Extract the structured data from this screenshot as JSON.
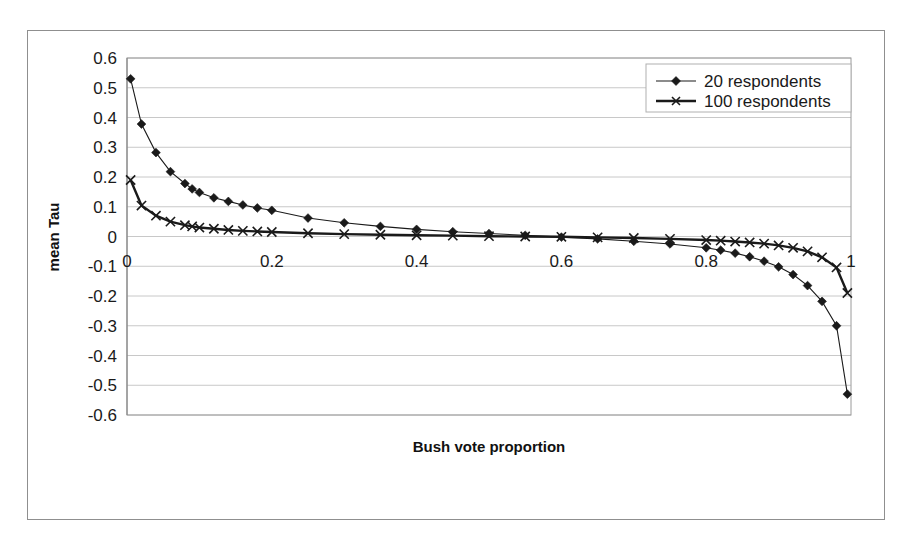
{
  "chart_data": {
    "type": "line",
    "title": "",
    "xlabel": "Bush vote proportion",
    "ylabel": "mean Tau",
    "xlim": [
      0,
      1
    ],
    "ylim": [
      -0.6,
      0.6
    ],
    "grid": true,
    "legend_position": "top-right",
    "xticks": [
      "0",
      "0.2",
      "0.4",
      "0.6",
      "0.8",
      "1"
    ],
    "xtick_values": [
      0,
      0.2,
      0.4,
      0.6,
      0.8,
      1
    ],
    "yticks": [
      "0.6",
      "0.5",
      "0.4",
      "0.3",
      "0.2",
      "0.1",
      "0",
      "-0.1",
      "-0.2",
      "-0.3",
      "-0.4",
      "-0.5",
      "-0.6"
    ],
    "ytick_values": [
      0.6,
      0.5,
      0.4,
      0.3,
      0.2,
      0.1,
      0,
      -0.1,
      -0.2,
      -0.3,
      -0.4,
      -0.5,
      -0.6
    ],
    "series": [
      {
        "name": "20 respondents",
        "marker": "diamond",
        "x": [
          0.005,
          0.02,
          0.04,
          0.06,
          0.08,
          0.09,
          0.1,
          0.12,
          0.14,
          0.16,
          0.18,
          0.2,
          0.25,
          0.3,
          0.35,
          0.4,
          0.45,
          0.5,
          0.55,
          0.6,
          0.65,
          0.7,
          0.75,
          0.8,
          0.82,
          0.84,
          0.86,
          0.88,
          0.9,
          0.92,
          0.94,
          0.96,
          0.98,
          0.995
        ],
        "values": [
          0.53,
          0.378,
          0.282,
          0.218,
          0.178,
          0.16,
          0.148,
          0.13,
          0.118,
          0.106,
          0.096,
          0.088,
          0.062,
          0.046,
          0.034,
          0.024,
          0.016,
          0.01,
          0.004,
          -0.002,
          -0.008,
          -0.016,
          -0.025,
          -0.038,
          -0.046,
          -0.056,
          -0.068,
          -0.083,
          -0.102,
          -0.128,
          -0.165,
          -0.218,
          -0.3,
          -0.53
        ]
      },
      {
        "name": "100 respondents",
        "marker": "x",
        "x": [
          0.005,
          0.02,
          0.04,
          0.06,
          0.08,
          0.09,
          0.1,
          0.12,
          0.14,
          0.16,
          0.18,
          0.2,
          0.25,
          0.3,
          0.35,
          0.4,
          0.45,
          0.5,
          0.55,
          0.6,
          0.65,
          0.7,
          0.75,
          0.8,
          0.82,
          0.84,
          0.86,
          0.88,
          0.9,
          0.92,
          0.94,
          0.96,
          0.98,
          0.995
        ],
        "values": [
          0.19,
          0.104,
          0.07,
          0.05,
          0.038,
          0.034,
          0.03,
          0.026,
          0.022,
          0.019,
          0.017,
          0.015,
          0.011,
          0.008,
          0.006,
          0.004,
          0.003,
          0.001,
          0.0,
          -0.001,
          -0.003,
          -0.005,
          -0.008,
          -0.012,
          -0.014,
          -0.017,
          -0.02,
          -0.024,
          -0.03,
          -0.038,
          -0.05,
          -0.07,
          -0.104,
          -0.19
        ]
      }
    ]
  },
  "legend": {
    "entries": [
      {
        "label": "20 respondents"
      },
      {
        "label": "100 respondents"
      }
    ]
  },
  "colors": {
    "series": "#1a1a1a",
    "gridline": "#c8c8c8",
    "frame": "#8f8f8f",
    "background": "#ffffff"
  }
}
